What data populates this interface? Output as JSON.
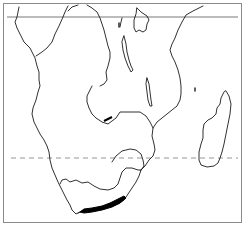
{
  "map": {
    "region": "Southern Africa",
    "style": "outline line map",
    "colors": {
      "background": "#ffffff",
      "frame": "#8a8a8a",
      "coastline": "#1a1a1a",
      "equator_line": "#555555",
      "tropic_line": "#8a8a8a",
      "highlight": "#000000"
    },
    "reference_lines": [
      {
        "name": "equator",
        "style": "solid",
        "y": 17
      },
      {
        "name": "tropic-of-capricorn",
        "style": "dashed",
        "y": 158
      }
    ],
    "highlighted_feature": "southern coastal strip"
  }
}
